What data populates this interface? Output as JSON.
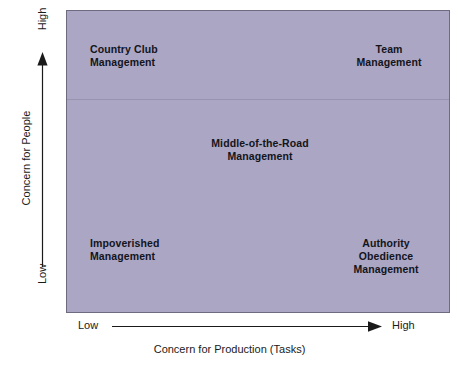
{
  "diagram": {
    "type": "matrix",
    "panel_color": "#aaa6c3",
    "panel_border_color": "#6e6a80",
    "text_color": "#14141c"
  },
  "axes": {
    "y": {
      "title": "Concern for People",
      "high_label": "High",
      "low_label": "Low",
      "arrow_direction": "up"
    },
    "x": {
      "title": "Concern for Production (Tasks)",
      "low_label": "Low",
      "high_label": "High",
      "arrow_direction": "right"
    }
  },
  "quadrants": [
    {
      "id": "country-club",
      "label": "Country Club\nManagement",
      "position": "top-left",
      "concern_for_people": "high",
      "concern_for_production": "low"
    },
    {
      "id": "team",
      "label": "Team\nManagement",
      "position": "top-right",
      "concern_for_people": "high",
      "concern_for_production": "high"
    },
    {
      "id": "middle-of-the-road",
      "label": "Middle-of-the-Road\nManagement",
      "position": "center",
      "concern_for_people": "medium",
      "concern_for_production": "medium"
    },
    {
      "id": "impoverished",
      "label": "Impoverished\nManagement",
      "position": "bottom-left",
      "concern_for_people": "low",
      "concern_for_production": "low"
    },
    {
      "id": "authority-obedience",
      "label": "Authority\nObedience\nManagement",
      "position": "bottom-right",
      "concern_for_people": "low",
      "concern_for_production": "high"
    }
  ]
}
